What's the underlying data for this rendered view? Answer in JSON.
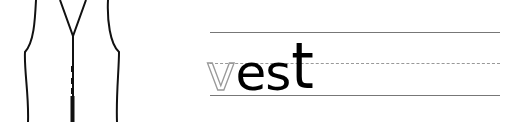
{
  "illustration": {
    "subject": "vest",
    "icon": "vest-outline-icon"
  },
  "worksheet": {
    "word": "vest",
    "traced_letter": "v",
    "solid_letters": "es",
    "tall_letter": "t"
  },
  "colors": {
    "ink": "#000000",
    "guide_line": "#777777",
    "dashed_line": "#999999",
    "traced_letter": "#999999"
  }
}
